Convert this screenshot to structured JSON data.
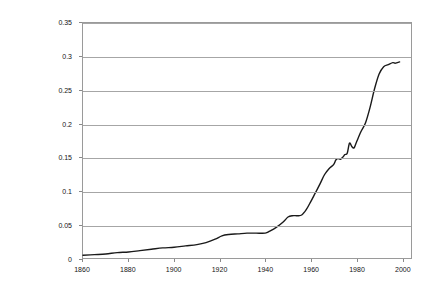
{
  "chart_data": {
    "type": "line",
    "title": "",
    "subtitle": "",
    "xlabel": "",
    "ylabel": "",
    "xlim": [
      1860,
      2004
    ],
    "ylim": [
      0,
      0.35
    ],
    "grid": true,
    "legend": false,
    "legend_position": "none",
    "x_ticks": [
      1860,
      1880,
      1900,
      1920,
      1940,
      1960,
      1980,
      2000
    ],
    "x_tick_labels": [
      "1860",
      "1880",
      "1900",
      "1920",
      "1940",
      "1960",
      "1980",
      "2000"
    ],
    "y_ticks": [
      0,
      0.05,
      0.1,
      0.15,
      0.2,
      0.25,
      0.3,
      0.35
    ],
    "y_tick_labels": [
      "0",
      "0.05",
      "0.1",
      "0.15",
      "0.2",
      "0.25",
      "0.3",
      "0.35"
    ],
    "series": [
      {
        "name": "series-1",
        "color": "#1a1a1a",
        "x": [
          1860,
          1865,
          1870,
          1875,
          1880,
          1885,
          1890,
          1895,
          1900,
          1905,
          1910,
          1914,
          1918,
          1921,
          1924,
          1928,
          1932,
          1936,
          1940,
          1942,
          1945,
          1948,
          1950,
          1952,
          1954,
          1956,
          1958,
          1960,
          1962,
          1964,
          1966,
          1968,
          1970,
          1971,
          1972,
          1973,
          1974,
          1975,
          1976,
          1977,
          1978,
          1979,
          1980,
          1982,
          1984,
          1986,
          1988,
          1990,
          1992,
          1994,
          1996,
          1997,
          1998,
          1999
        ],
        "values": [
          0.004,
          0.005,
          0.006,
          0.008,
          0.009,
          0.011,
          0.013,
          0.015,
          0.016,
          0.018,
          0.02,
          0.023,
          0.028,
          0.033,
          0.035,
          0.036,
          0.037,
          0.037,
          0.037,
          0.04,
          0.046,
          0.054,
          0.061,
          0.063,
          0.063,
          0.064,
          0.072,
          0.084,
          0.097,
          0.11,
          0.124,
          0.133,
          0.139,
          0.146,
          0.148,
          0.147,
          0.15,
          0.154,
          0.156,
          0.171,
          0.166,
          0.164,
          0.172,
          0.188,
          0.201,
          0.224,
          0.252,
          0.274,
          0.285,
          0.288,
          0.291,
          0.29,
          0.291,
          0.292
        ]
      }
    ]
  }
}
